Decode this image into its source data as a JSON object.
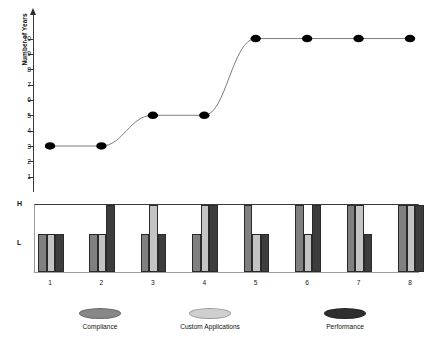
{
  "chart_data": {
    "type": "line",
    "title": "",
    "subtitle": "",
    "xlabel": "",
    "ylabel": "Number of Years",
    "x": [
      1,
      2,
      3,
      4,
      5,
      6,
      7,
      8
    ],
    "xticklabels": [
      "1",
      "2",
      "3",
      "4",
      "5",
      "6",
      "7",
      "8"
    ],
    "yticklabels": [
      "1",
      "2",
      "3",
      "4",
      "5",
      "6",
      "7",
      "8",
      "9",
      "10"
    ],
    "ylim": [
      0,
      11.6
    ],
    "ytick_values": [
      1,
      2,
      3,
      4,
      5,
      6,
      7,
      8,
      9,
      10
    ],
    "grid": false,
    "legend_position": "bottom",
    "marker": "filled-ellipse",
    "line_color": "#6f6f6f",
    "marker_color": "#000000",
    "values": [
      3,
      3,
      5,
      5,
      10,
      10,
      10,
      10
    ],
    "series": [
      {
        "name": "Number of Years",
        "values": [
          3,
          3,
          5,
          5,
          10,
          10,
          10,
          10
        ]
      }
    ]
  },
  "secondary_chart": {
    "type": "bar",
    "axis_labels": [
      "H",
      "L"
    ],
    "levels": {
      "H": "high",
      "L": "low"
    },
    "categories": [
      "1",
      "2",
      "3",
      "4",
      "5",
      "6",
      "7",
      "8"
    ],
    "series": [
      {
        "name": "Compliance",
        "color": "#808080",
        "levels": [
          "L",
          "L",
          "L",
          "L",
          "H",
          "H",
          "H",
          "H"
        ]
      },
      {
        "name": "Custom Applications",
        "color": "#c4c4c4",
        "levels": [
          "L",
          "L",
          "H",
          "H",
          "L",
          "L",
          "H",
          "H"
        ]
      },
      {
        "name": "Performance",
        "color": "#3d3d3d",
        "levels": [
          "L",
          "H",
          "L",
          "H",
          "L",
          "H",
          "L",
          "H"
        ]
      }
    ]
  },
  "yaxis": {
    "title": "Number of Years",
    "ticks": [
      "10",
      "9",
      "8",
      "7",
      "6",
      "5",
      "4",
      "3",
      "2",
      "1"
    ]
  },
  "xaxis": {
    "ticks": [
      "1",
      "2",
      "3",
      "4",
      "5",
      "6",
      "7",
      "8"
    ]
  },
  "bar_axis": {
    "high_label": "H",
    "low_label": "L"
  },
  "legend": {
    "items": [
      {
        "label": "Compliance",
        "color": "#878787"
      },
      {
        "label": "Custom Applications",
        "color": "#cfcfcf"
      },
      {
        "label": "Performance",
        "color": "#2f2f2f"
      }
    ]
  }
}
